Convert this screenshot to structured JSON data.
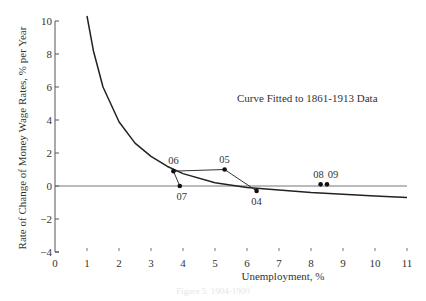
{
  "chart_data": {
    "type": "line",
    "title": "",
    "annotation": "Curve Fitted to 1861-1913 Data",
    "xlabel": "Unemployment, %",
    "ylabel": "Rate of Change of Money Wage Rates, % per Year",
    "xlim": [
      0,
      11
    ],
    "ylim": [
      -4,
      10
    ],
    "x_ticks": [
      "0",
      "1",
      "2",
      "3",
      "4",
      "5",
      "6",
      "7",
      "8",
      "9",
      "10",
      "11"
    ],
    "y_ticks": [
      "10",
      "8",
      "6",
      "4",
      "2",
      "0",
      "-2",
      "-4"
    ],
    "grid": false,
    "reference_line": {
      "y": 0
    },
    "series": [
      {
        "name": "Curve Fitted to 1861-1913 Data",
        "style": "curve",
        "x": [
          1.0,
          1.2,
          1.5,
          2.0,
          2.5,
          3.0,
          3.5,
          4.0,
          5.0,
          6.0,
          7.0,
          8.0,
          9.0,
          10.0,
          11.0
        ],
        "y": [
          10.5,
          8.2,
          6.0,
          3.9,
          2.6,
          1.8,
          1.2,
          0.75,
          0.2,
          -0.1,
          -0.25,
          -0.4,
          -0.5,
          -0.6,
          -0.7
        ]
      },
      {
        "name": "Observed 1904-1909",
        "style": "connected-points",
        "points": [
          {
            "label": "04",
            "x": 6.3,
            "y": -0.3
          },
          {
            "label": "05",
            "x": 5.3,
            "y": 1.0
          },
          {
            "label": "06",
            "x": 3.7,
            "y": 0.9
          },
          {
            "label": "07",
            "x": 3.9,
            "y": 0.0
          },
          {
            "label": "08",
            "x": 8.3,
            "y": 0.1
          },
          {
            "label": "09",
            "x": 8.5,
            "y": 0.1
          }
        ]
      }
    ]
  },
  "caption": "Figure 5. 1904-1909"
}
